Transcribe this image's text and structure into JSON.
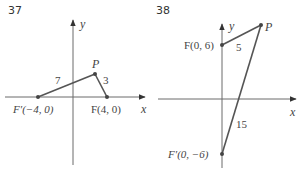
{
  "figures": [
    {
      "number": "37",
      "axis_x_label": "x",
      "axis_y_label": "y",
      "points": {
        "P": "P",
        "F": "F(4, 0)",
        "F_prime": "F′(−4, 0)"
      },
      "segment_labels": {
        "F_prime_to_P": "7",
        "P_to_F": "3"
      }
    },
    {
      "number": "38",
      "axis_x_label": "x",
      "axis_y_label": "y",
      "points": {
        "P": "P",
        "F": "F(0, 6)",
        "F_prime": "F′(0, −6)"
      },
      "segment_labels": {
        "F_to_P": "5",
        "F_prime_to_P": "15"
      }
    }
  ]
}
